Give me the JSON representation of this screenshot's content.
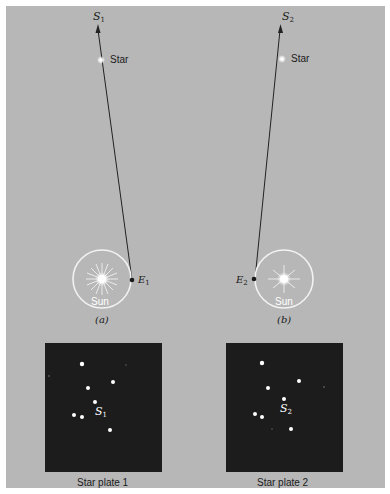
{
  "panel_a": {
    "direction_label": "S",
    "direction_sub": "1",
    "star_label": "Star",
    "sun_label": "Sun",
    "earth_label": "E",
    "earth_sub": "1",
    "caption": "(a)"
  },
  "panel_b": {
    "direction_label": "S",
    "direction_sub": "2",
    "star_label": "Star",
    "sun_label": "Sun",
    "earth_label": "E",
    "earth_sub": "2",
    "caption": "(b)"
  },
  "plate_1": {
    "star_label": "S",
    "star_sub": "1",
    "caption": "Star plate 1"
  },
  "plate_2": {
    "star_label": "S",
    "star_sub": "2",
    "caption": "Star plate 2"
  },
  "colors": {
    "background": "#b7b7b7",
    "plate": "#1c1c1c",
    "line": "#222222",
    "sun_ring": "#f2f2f2"
  }
}
